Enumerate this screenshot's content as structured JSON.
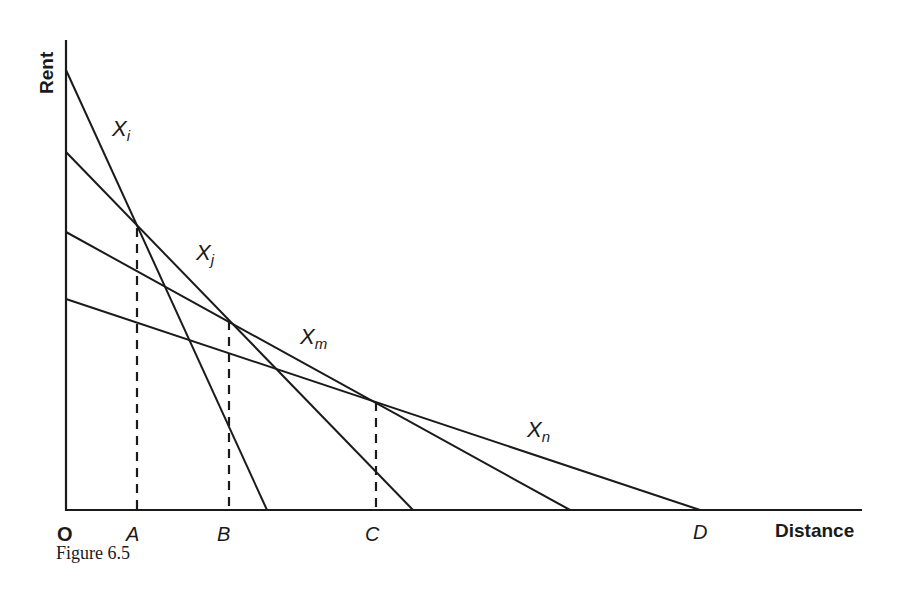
{
  "figure": {
    "caption": "Figure 6.5",
    "y_axis_label": "Rent",
    "x_axis_label": "Distance",
    "origin_label": "O"
  },
  "points": [
    {
      "label": "A"
    },
    {
      "label": "B"
    },
    {
      "label": "C"
    },
    {
      "label": "D"
    }
  ],
  "curves": [
    {
      "name": "X",
      "sub": "i"
    },
    {
      "name": "X",
      "sub": "j"
    },
    {
      "name": "X",
      "sub": "m"
    },
    {
      "name": "X",
      "sub": "n"
    }
  ],
  "colors": {
    "ink": "#1a1a1a",
    "background": "#ffffff"
  }
}
